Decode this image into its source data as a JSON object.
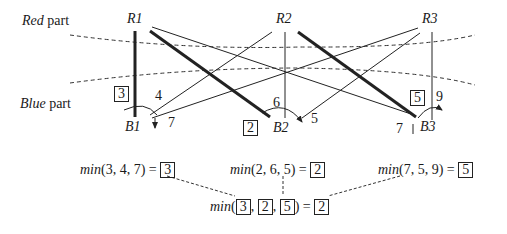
{
  "parts": {
    "red_label_italic": "Red",
    "red_label_rest": " part",
    "blue_label_italic": "Blue",
    "blue_label_rest": " part"
  },
  "nodes": {
    "red": [
      "R1",
      "R2",
      "R3"
    ],
    "blue": [
      "B1",
      "B2",
      "B3"
    ]
  },
  "edge_weights": {
    "B1": {
      "R1": "3",
      "R2": "4",
      "R3": "7",
      "selected": "3"
    },
    "B2": {
      "R1": "2",
      "R2": "6",
      "R3": "5",
      "selected": "2"
    },
    "B3": {
      "R1": "7",
      "R2": "5",
      "R3": "9",
      "selected": "5"
    }
  },
  "equations": {
    "b1": {
      "fn": "min",
      "args": "(3, 4, 7) = ",
      "result": "3"
    },
    "b2": {
      "fn": "min",
      "args": "(2, 6, 5) = ",
      "result": "2"
    },
    "b3": {
      "fn": "min",
      "args": "(7, 5, 9) = ",
      "result": "5"
    },
    "final": {
      "fn": "min",
      "open": "(",
      "a": "3",
      "sep1": ", ",
      "b": "2",
      "sep2": ", ",
      "c": "5",
      "close": ") = ",
      "result": "2"
    }
  },
  "colors": {
    "line": "#222222",
    "background": "#ffffff"
  }
}
